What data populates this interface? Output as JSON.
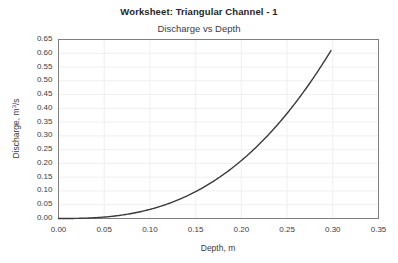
{
  "chart_data": {
    "type": "line",
    "title": "Worksheet: Triangular Channel - 1",
    "subtitle": "Discharge vs Depth",
    "xlabel": "Depth, m",
    "ylabel_prefix": "Discharge, m",
    "ylabel_sup": "3",
    "ylabel_suffix": "/s",
    "ylabel": "Discharge, m3/s",
    "xlim": [
      0.0,
      0.35
    ],
    "ylim": [
      0.0,
      0.65
    ],
    "xticks": [
      "0.00",
      "0.05",
      "0.10",
      "0.15",
      "0.20",
      "0.25",
      "0.30",
      "0.35"
    ],
    "xtick_values": [
      0.0,
      0.05,
      0.1,
      0.15,
      0.2,
      0.25,
      0.3,
      0.35
    ],
    "yticks": [
      "0.00",
      "0.05",
      "0.10",
      "0.15",
      "0.20",
      "0.25",
      "0.30",
      "0.35",
      "0.40",
      "0.45",
      "0.50",
      "0.55",
      "0.60",
      "0.65"
    ],
    "ytick_values": [
      0.0,
      0.05,
      0.1,
      0.15,
      0.2,
      0.25,
      0.3,
      0.35,
      0.4,
      0.45,
      0.5,
      0.55,
      0.6,
      0.65
    ],
    "grid": true,
    "legend": false,
    "line_color": "#3b3b3b",
    "grid_color": "#efefef",
    "frame_color": "#7f7f7f",
    "background_color": "#ffffff",
    "series": [
      {
        "name": "Discharge vs Depth",
        "x": [
          0.0,
          0.01,
          0.02,
          0.03,
          0.04,
          0.05,
          0.06,
          0.07,
          0.08,
          0.09,
          0.1,
          0.11,
          0.12,
          0.13,
          0.14,
          0.15,
          0.16,
          0.17,
          0.18,
          0.19,
          0.2,
          0.21,
          0.22,
          0.23,
          0.24,
          0.25,
          0.26,
          0.27,
          0.28,
          0.29,
          0.298
        ],
        "y": [
          0.0,
          0.0,
          0.001,
          0.003,
          0.006,
          0.01,
          0.016,
          0.023,
          0.032,
          0.043,
          0.056,
          0.071,
          0.088,
          0.107,
          0.128,
          0.152,
          0.178,
          0.206,
          0.237,
          0.27,
          0.305,
          0.343,
          0.384,
          0.427,
          0.473,
          0.521,
          0.572,
          0.626,
          0.683,
          0.742,
          0.61
        ]
      }
    ],
    "curve_model": {
      "form": "Q = k * y^n",
      "k": 13.2,
      "n": 2.67,
      "y_start": 0.0,
      "y_end": 0.298,
      "q_end": 0.61
    }
  }
}
